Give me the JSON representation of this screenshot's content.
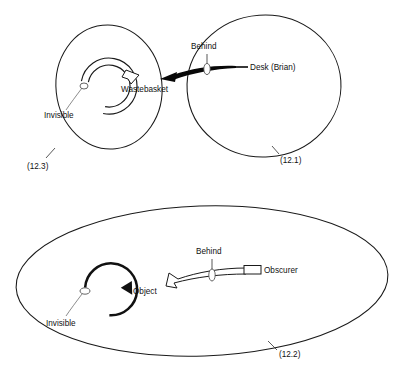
{
  "figure": {
    "background_color": "#ffffff",
    "ink_color": "#111111",
    "leader_color": "#6f6f6f"
  },
  "panels": [
    {
      "id": "top",
      "figure_number": "(12.3)",
      "figure_number_right": "(12.1)",
      "labels": {
        "center_object": "Wastebasket",
        "invisible": "Invisible",
        "behind": "Behind",
        "source": "Desk (Brian)"
      }
    },
    {
      "id": "bottom",
      "figure_number": "(12.2)",
      "labels": {
        "center_object": "Object",
        "invisible": "Invisible",
        "behind": "Behind",
        "source": "Obscurer"
      }
    }
  ],
  "top_panel": {
    "left_region_label": "(12.3)",
    "right_region_label": "(12.1)",
    "object_label": "Wastebasket",
    "invisible_label": "Invisible",
    "behind_label": "Behind",
    "obscurer_label": "Desk (Brian)"
  },
  "bottom_panel": {
    "region_label": "(12.2)",
    "object_label": "Object",
    "invisible_label": "Invisible",
    "behind_label": "Behind",
    "obscurer_label": "Obscurer"
  }
}
